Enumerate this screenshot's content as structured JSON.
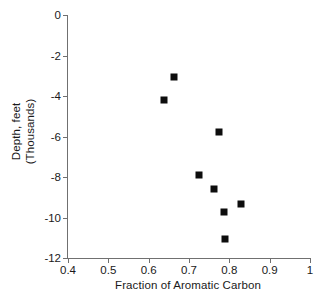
{
  "chart_data": {
    "type": "scatter",
    "title": "",
    "xlabel": "Fraction of Aromatic Carbon",
    "ylabel_line1": "Depth, feet",
    "ylabel_line2": "(Thousands)",
    "xlim": [
      0.4,
      1.0
    ],
    "ylim": [
      -12,
      0
    ],
    "grid": false,
    "legend": null,
    "xticks": [
      "0.4",
      "0.5",
      "0.6",
      "0.7",
      "0.8",
      "0.9",
      "1"
    ],
    "xtick_values": [
      0.4,
      0.5,
      0.6,
      0.7,
      0.8,
      0.9,
      1.0
    ],
    "yticks": [
      "0",
      "-2",
      "-4",
      "-6",
      "-8",
      "-10",
      "-12"
    ],
    "ytick_values": [
      0,
      -2,
      -4,
      -6,
      -8,
      -10,
      -12
    ],
    "marker": "square",
    "marker_color": "#0d0d0d",
    "axis_color": "#707070",
    "points": [
      {
        "x": 0.663,
        "y": -3.06
      },
      {
        "x": 0.638,
        "y": -4.2
      },
      {
        "x": 0.774,
        "y": -5.78
      },
      {
        "x": 0.725,
        "y": -7.9
      },
      {
        "x": 0.762,
        "y": -8.59
      },
      {
        "x": 0.829,
        "y": -9.33
      },
      {
        "x": 0.787,
        "y": -9.73
      },
      {
        "x": 0.789,
        "y": -11.06
      }
    ]
  }
}
